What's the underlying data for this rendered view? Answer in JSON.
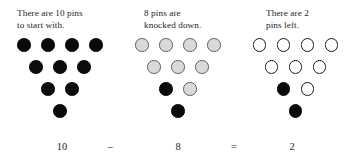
{
  "figure": {
    "colors": {
      "background": "#ffffff",
      "pin_standing": "#0b0b0b",
      "pin_knocked_down_fill": "#d9d9d9",
      "pin_knocked_down_stroke": "#5e5e5e",
      "pin_empty_fill": "#ffffff",
      "pin_empty_stroke": "#1a1a1a",
      "text": "#1c1c1c"
    }
  },
  "panels": [
    {
      "id": "panel-total",
      "caption": "There are 10 pins\nto start with.",
      "number": "10",
      "rows": [
        [
          "standing",
          "standing",
          "standing",
          "standing"
        ],
        [
          "standing",
          "standing",
          "standing"
        ],
        [
          "standing",
          "standing"
        ],
        [
          "standing"
        ]
      ]
    },
    {
      "id": "panel-knocked-down",
      "caption": "8 pins are\nknocked down.",
      "number": "8",
      "rows": [
        [
          "down",
          "down",
          "down",
          "down"
        ],
        [
          "down",
          "down",
          "down"
        ],
        [
          "standing",
          "down"
        ],
        [
          "standing"
        ]
      ]
    },
    {
      "id": "panel-remaining",
      "caption": "There are 2\npins left.",
      "number": "2",
      "rows": [
        [
          "empty",
          "empty",
          "empty",
          "empty"
        ],
        [
          "empty",
          "empty",
          "empty"
        ],
        [
          "standing",
          "empty"
        ],
        [
          "standing"
        ]
      ]
    }
  ],
  "equation": {
    "minuend": "10",
    "operator_subtract": "–",
    "subtrahend": "8",
    "operator_equals": "=",
    "difference": "2"
  }
}
